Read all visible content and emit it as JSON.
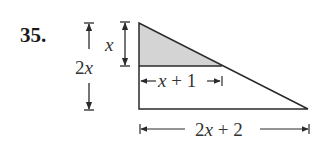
{
  "problem": {
    "number": "35.",
    "labels": {
      "small_height": "x",
      "total_height": "2x",
      "small_base": "x + 1",
      "total_base": "2x + 2"
    },
    "colors": {
      "shade": "#d4d4d4",
      "stroke": "#2a2a2a"
    }
  }
}
